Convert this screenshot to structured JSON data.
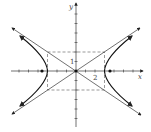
{
  "diagram": {
    "type": "hyperbola-graph",
    "equation_implied": "x^2/9 - y^2/4 = 1",
    "axes": {
      "x_label": "x",
      "y_label": "y",
      "x_tick_label": "2",
      "y_tick_label": "1"
    },
    "params": {
      "a": 3,
      "b": 2,
      "c_approx": 3.6
    },
    "elements": [
      "x-axis with arrow",
      "y-axis with arrow",
      "two asymptotes y = ±(2/3)x with arrows",
      "dashed central rectangle (±3, ±2)",
      "left and right hyperbola branches with arrows",
      "foci dots at (±3.6, 0)",
      "center dot at origin"
    ],
    "colors": {
      "stroke": "#222222",
      "dashed": "#555555",
      "background": "#ffffff"
    }
  }
}
